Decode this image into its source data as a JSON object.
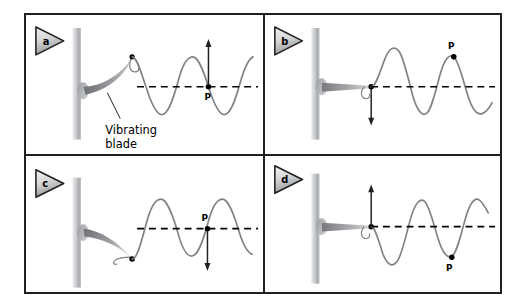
{
  "figure": {
    "background_color": "#ffffff",
    "border_color": "#231f20",
    "panel_count": 4
  },
  "style": {
    "wave_color": "#808285",
    "axis_color": "#000000",
    "post_color_light": "#d6d7d8",
    "post_color_mid": "#a7a9ac",
    "blade_color": "#808285",
    "dot_color": "#000000",
    "tag_fill_light": "#e6e7e8",
    "tag_fill_dark": "#9d9fa2",
    "tag_outline": "#231f20"
  },
  "annotation": {
    "label_line1": "Vibrating",
    "label_line2": "blade",
    "leader_line": "leader-line-to-blade"
  },
  "panels": [
    {
      "id": "a",
      "tag_label": "a",
      "point_label": "P",
      "point_position": "on-axis-rising",
      "point_label_placement": "below-right",
      "arrow_direction": "up",
      "arrow_location": "at-point-p",
      "blade_state": "bent-up",
      "source_dot": "at-blade-tip-crest",
      "has_annotation": true,
      "wave_phase_deg": 0,
      "wave_cycles": 2.6
    },
    {
      "id": "b",
      "tag_label": "b",
      "point_label": "P",
      "point_position": "at-crest",
      "point_label_placement": "above",
      "arrow_direction": "down",
      "arrow_location": "at-blade-tip",
      "blade_state": "straight",
      "source_dot": "at-blade-tip-axis",
      "has_annotation": false,
      "wave_phase_deg": 0,
      "wave_cycles": 2.6
    },
    {
      "id": "c",
      "tag_label": "c",
      "point_label": "P",
      "point_position": "on-axis-falling",
      "point_label_placement": "above",
      "arrow_direction": "down",
      "arrow_location": "at-point-p",
      "blade_state": "bent-down",
      "source_dot": "at-blade-tip-trough",
      "has_annotation": false,
      "wave_phase_deg": 180,
      "wave_cycles": 2.6
    },
    {
      "id": "d",
      "tag_label": "d",
      "point_label": "P",
      "point_position": "at-trough",
      "point_label_placement": "below",
      "arrow_direction": "up",
      "arrow_location": "at-blade-tip",
      "blade_state": "straight",
      "source_dot": "at-blade-tip-axis",
      "has_annotation": false,
      "wave_phase_deg": 180,
      "wave_cycles": 2.6
    }
  ]
}
